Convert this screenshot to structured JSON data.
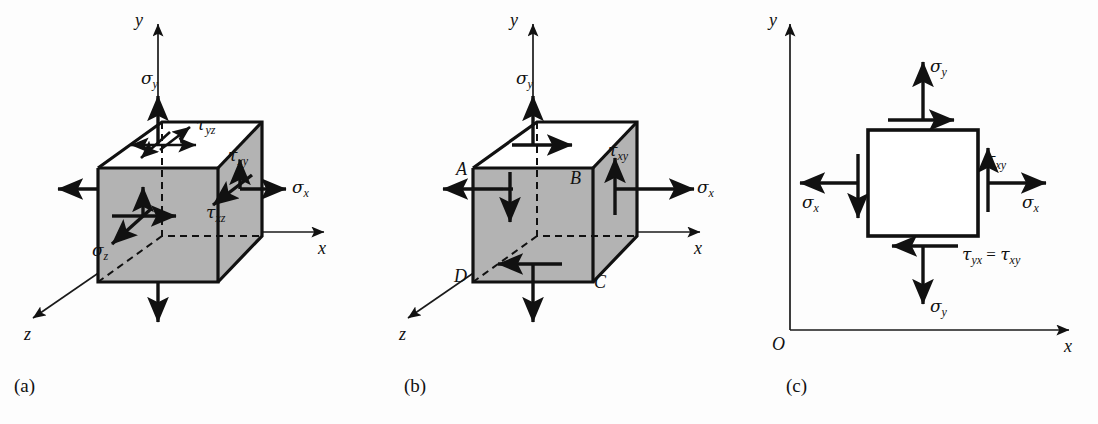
{
  "figure": {
    "background_color": "#fdfdfd",
    "ink_color": "#111111",
    "shaded_face_color": "#b3b3b3"
  },
  "panels": [
    {
      "id": "a",
      "caption": "(a)",
      "description": "Three-dimensional state of stress on a cubic element",
      "axes": [
        {
          "name": "y-axis",
          "label": "y"
        },
        {
          "name": "x-axis",
          "label": "x"
        },
        {
          "name": "z-axis",
          "label": "z"
        }
      ],
      "stress_labels": [
        {
          "name": "sigma-y",
          "sym": "σ",
          "sub": "y"
        },
        {
          "name": "sigma-x",
          "sym": "σ",
          "sub": "x"
        },
        {
          "name": "sigma-z",
          "sym": "σ",
          "sub": "z"
        },
        {
          "name": "tau-yz",
          "sym": "τ",
          "sub": "yz"
        },
        {
          "name": "tau-xy",
          "sym": "τ",
          "sub": "xy"
        },
        {
          "name": "tau-xz",
          "sym": "τ",
          "sub": "xz"
        }
      ]
    },
    {
      "id": "b",
      "caption": "(b)",
      "description": "Plane stress element with corner points A, B, C, D",
      "axes": [
        {
          "name": "y-axis",
          "label": "y"
        },
        {
          "name": "x-axis",
          "label": "x"
        },
        {
          "name": "z-axis",
          "label": "z"
        }
      ],
      "stress_labels": [
        {
          "name": "sigma-y",
          "sym": "σ",
          "sub": "y"
        },
        {
          "name": "sigma-x",
          "sym": "σ",
          "sub": "x"
        },
        {
          "name": "tau-xy",
          "sym": "τ",
          "sub": "xy"
        }
      ],
      "corner_points": [
        {
          "name": "point-a",
          "label": "A"
        },
        {
          "name": "point-b",
          "label": "B"
        },
        {
          "name": "point-c",
          "label": "C"
        },
        {
          "name": "point-d",
          "label": "D"
        }
      ]
    },
    {
      "id": "c",
      "caption": "(c)",
      "description": "Two-dimensional plane stress square element in the xy-plane",
      "axes": [
        {
          "name": "y-axis",
          "label": "y"
        },
        {
          "name": "x-axis",
          "label": "x"
        },
        {
          "name": "origin",
          "label": "O"
        }
      ],
      "stress_labels": [
        {
          "name": "sigma-y-top",
          "sym": "σ",
          "sub": "y"
        },
        {
          "name": "sigma-y-bottom",
          "sym": "σ",
          "sub": "y"
        },
        {
          "name": "sigma-x-left",
          "sym": "σ",
          "sub": "x"
        },
        {
          "name": "sigma-x-right",
          "sym": "σ",
          "sub": "x"
        },
        {
          "name": "tau-xy",
          "sym": "τ",
          "sub": "xy"
        }
      ],
      "relation": {
        "name": "tau-equality",
        "lhs_sym": "τ",
        "lhs_sub": "yx",
        "operator": "=",
        "rhs_sym": "τ",
        "rhs_sub": "xy"
      }
    }
  ]
}
